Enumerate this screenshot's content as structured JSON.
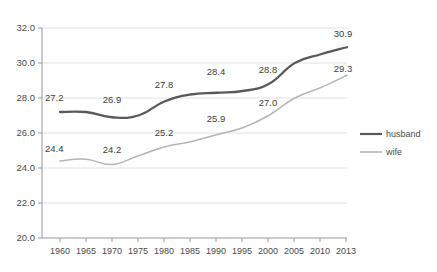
{
  "chart_data": {
    "type": "line",
    "title": "",
    "subtitle": "",
    "xlabel": "",
    "ylabel": "",
    "categories": [
      "1960",
      "1965",
      "1970",
      "1975",
      "1980",
      "1985",
      "1990",
      "1995",
      "2000",
      "2005",
      "2010",
      "2013"
    ],
    "x": [
      1960,
      1965,
      1970,
      1975,
      1980,
      1985,
      1990,
      1995,
      2000,
      2005,
      2010,
      2013
    ],
    "ylim": [
      20.0,
      32.0
    ],
    "ytick_values": [
      20.0,
      22.0,
      24.0,
      26.0,
      28.0,
      30.0,
      32.0
    ],
    "ytick_labels": [
      "20.0",
      "22.0",
      "24.0",
      "26.0",
      "28.0",
      "30.0",
      "32.0"
    ],
    "grid": true,
    "grid_axis": "y",
    "legend_position": "right",
    "series": [
      {
        "name": "husband",
        "color": "#595959",
        "values": [
          27.2,
          27.2,
          26.9,
          27.0,
          27.8,
          28.2,
          28.3,
          28.4,
          28.8,
          30.0,
          30.5,
          30.9
        ],
        "labeled_points": [
          {
            "category": "1960",
            "value": 27.2,
            "text": "27.2"
          },
          {
            "category": "1970",
            "value": 26.9,
            "text": "26.9"
          },
          {
            "category": "1980",
            "value": 27.8,
            "text": "27.8"
          },
          {
            "category": "1990",
            "value": 28.3,
            "text": "28.4"
          },
          {
            "category": "2000",
            "value": 28.8,
            "text": "28.8"
          },
          {
            "category": "2013",
            "value": 30.9,
            "text": "30.9"
          }
        ]
      },
      {
        "name": "wife",
        "color": "#b5b5b5",
        "values": [
          24.4,
          24.5,
          24.2,
          24.7,
          25.2,
          25.5,
          25.9,
          26.3,
          27.0,
          28.0,
          28.6,
          29.3
        ],
        "labeled_points": [
          {
            "category": "1960",
            "value": 24.4,
            "text": "24.4"
          },
          {
            "category": "1970",
            "value": 24.2,
            "text": "24.2"
          },
          {
            "category": "1980",
            "value": 25.2,
            "text": "25.2"
          },
          {
            "category": "1990",
            "value": 25.9,
            "text": "25.9"
          },
          {
            "category": "2000",
            "value": 27.0,
            "text": "27.0"
          },
          {
            "category": "2013",
            "value": 29.3,
            "text": "29.3"
          }
        ]
      }
    ],
    "annotations": [
      {
        "text": "27.2",
        "series": "husband",
        "category": "1960"
      },
      {
        "text": "26.9",
        "series": "husband",
        "category": "1970"
      },
      {
        "text": "27.8",
        "series": "husband",
        "category": "1980"
      },
      {
        "text": "28.4",
        "series": "husband",
        "category": "1990"
      },
      {
        "text": "28.8",
        "series": "husband",
        "category": "2000"
      },
      {
        "text": "30.9",
        "series": "husband",
        "category": "2013"
      },
      {
        "text": "24.4",
        "series": "wife",
        "category": "1960"
      },
      {
        "text": "24.2",
        "series": "wife",
        "category": "1970"
      },
      {
        "text": "25.2",
        "series": "wife",
        "category": "1980"
      },
      {
        "text": "25.9",
        "series": "wife",
        "category": "1990"
      },
      {
        "text": "27.0",
        "series": "wife",
        "category": "2000"
      },
      {
        "text": "29.3",
        "series": "wife",
        "category": "2013"
      }
    ]
  },
  "legend": {
    "items": [
      {
        "label": "husband",
        "color": "#595959"
      },
      {
        "label": "wife",
        "color": "#b5b5b5"
      }
    ]
  },
  "axis": {
    "y_labels": [
      "32.0",
      "30.0",
      "28.0",
      "26.0",
      "24.0",
      "22.0",
      "20.0"
    ],
    "x_labels": [
      "1960",
      "1965",
      "1970",
      "1975",
      "1980",
      "1985",
      "1990",
      "1995",
      "2000",
      "2005",
      "2010",
      "2013"
    ]
  },
  "colors": {
    "husband": "#595959",
    "wife": "#b5b5b5",
    "grid": "#d9d9d9",
    "axis": "#8c8c8c",
    "text": "#4a4a4a",
    "background": "#ffffff"
  },
  "labels": {
    "h_1960": "27.2",
    "h_1970": "26.9",
    "h_1980": "27.8",
    "h_1990": "28.4",
    "h_2000": "28.8",
    "h_2013": "30.9",
    "w_1960": "24.4",
    "w_1970": "24.2",
    "w_1980": "25.2",
    "w_1990": "25.9",
    "w_2000": "27.0",
    "w_2013": "29.3"
  }
}
